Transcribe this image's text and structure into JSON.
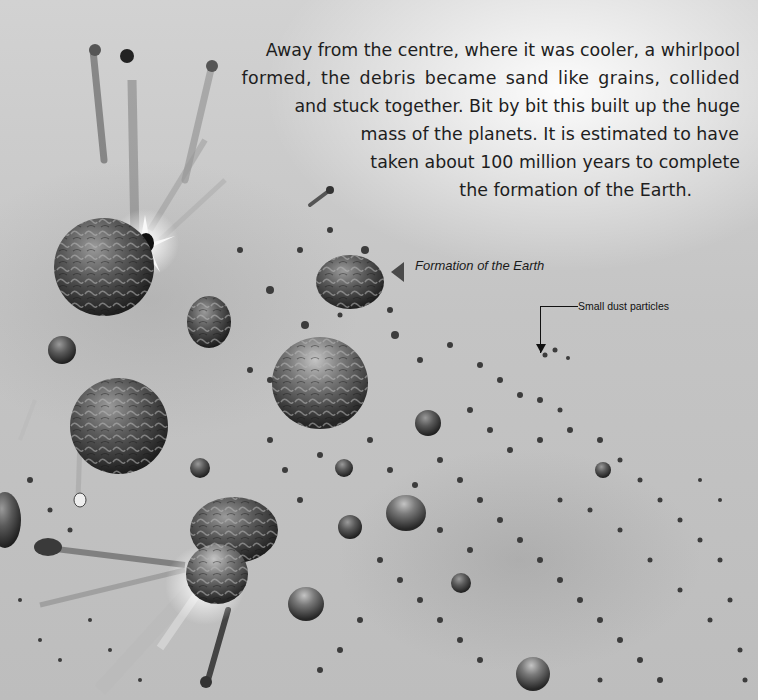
{
  "page": {
    "type": "illustrated book page",
    "palette": {
      "background": "#c9c9c9",
      "highlight": "#f4f4f4",
      "rock_dark": "#2a2a2a",
      "rock_mid": "#6a6a6a",
      "text": "#1e1e1e"
    }
  },
  "body_text": {
    "lines": [
      "Away from the centre, where it was cooler, a whirlpool",
      "formed, the debris became sand like grains, collided",
      "and stuck together. Bit by bit this built up the huge",
      "mass of the planets. It is estimated to have",
      "taken about 100 million years to complete",
      "the formation of the Earth."
    ]
  },
  "labels": {
    "formation_caption": "Formation of the Earth",
    "dust_caption": "Small dust particles"
  },
  "illustration": {
    "subject": "planetesimals colliding and accreting in a dust cloud",
    "icons": [
      "planetesimal-rock",
      "impact-flash",
      "dust-particle",
      "debris-trail"
    ]
  }
}
